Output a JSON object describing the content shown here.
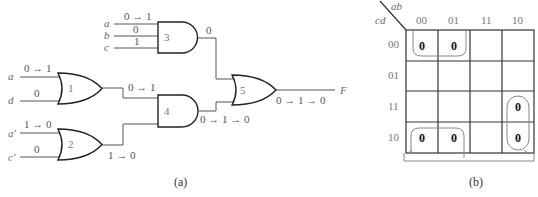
{
  "circuit": {
    "caption": "(a)",
    "inputs": {
      "g3_a": {
        "name": "a",
        "value": "0 → 1"
      },
      "g3_b": {
        "name": "b",
        "value": "0"
      },
      "g3_c": {
        "name": "c",
        "value": "1"
      },
      "g1_a": {
        "name": "a",
        "value": "0 → 1"
      },
      "g1_d": {
        "name": "d",
        "value": "0"
      },
      "g2_a": {
        "name": "a′",
        "value": "1 → 0"
      },
      "g2_c": {
        "name": "c′",
        "value": "0"
      }
    },
    "gates": {
      "g1": {
        "label": "1",
        "type": "OR"
      },
      "g2": {
        "label": "2",
        "type": "OR"
      },
      "g3": {
        "label": "3",
        "type": "AND"
      },
      "g4": {
        "label": "4",
        "type": "AND"
      },
      "g5": {
        "label": "5",
        "type": "OR"
      }
    },
    "signals": {
      "g3_out": "0",
      "g1_out": "0 → 1",
      "g2_out": "1 → 0",
      "g4_out": "0 → 1 → 0",
      "g5_out": "0 → 1 → 0"
    },
    "output_name": "F"
  },
  "kmap": {
    "caption": "(b)",
    "col_var": "ab",
    "row_var": "cd",
    "col_headers": [
      "00",
      "01",
      "11",
      "10"
    ],
    "row_headers": [
      "00",
      "01",
      "11",
      "10"
    ],
    "cells": [
      [
        "0",
        "0",
        "",
        ""
      ],
      [
        "",
        "",
        "",
        ""
      ],
      [
        "",
        "",
        "",
        "0"
      ],
      [
        "0",
        "0",
        "",
        "0"
      ]
    ]
  },
  "figure_label": "Figure 25-5"
}
